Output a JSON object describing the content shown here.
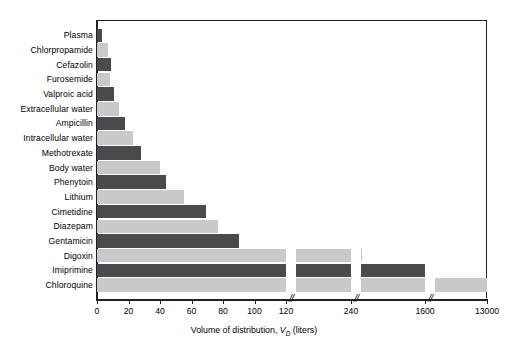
{
  "chart_data": {
    "type": "bar",
    "orientation": "horizontal",
    "title": "",
    "xlabel": "Volume of distribution, V_D (liters)",
    "xlabel_main": "Volume of distribution,",
    "xlabel_symbol": "V",
    "xlabel_subscript": "D",
    "xlabel_unit": "(liters)",
    "ylabel": "",
    "grid": false,
    "legend": "none",
    "xticks": [
      0,
      20,
      40,
      60,
      80,
      100,
      120,
      240,
      1600,
      13000
    ],
    "xtick_labels": [
      "0",
      "20",
      "40",
      "60",
      "80",
      "100",
      "120",
      "240",
      "1600",
      "13000"
    ],
    "axis_breaks": 3,
    "axis_break_symbol": "//",
    "categories": [
      "Plasma",
      "Chlorpropamide",
      "Cefazolin",
      "Furosemide",
      "Valproic acid",
      "Extracellular water",
      "Ampicillin",
      "Intracellular water",
      "Methotrexate",
      "Body water",
      "Phenytoin",
      "Lithium",
      "Cimetidine",
      "Diazepam",
      "Gentamicin",
      "Digoxin",
      "Imiprimine",
      "Chloroquine"
    ],
    "values": [
      3,
      7,
      9,
      8,
      11,
      14,
      18,
      23,
      28,
      40,
      44,
      55,
      69,
      77,
      90,
      250,
      1600,
      13000
    ],
    "colors": {
      "dark": "#4a4a4c",
      "light": "#c9c9c9",
      "axis": "#231f20",
      "background": "#ffffff"
    }
  }
}
